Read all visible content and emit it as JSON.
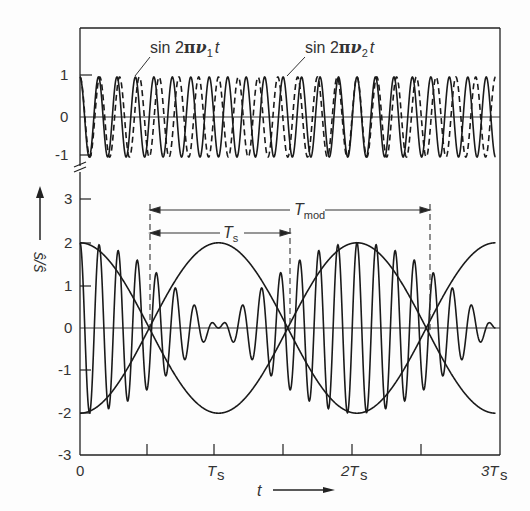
{
  "chart_data": [
    {
      "type": "line",
      "panel": "upper",
      "title": "",
      "series": [
        {
          "name": "sin 2πν1t",
          "style": "solid",
          "amplitude": 1,
          "relative_frequency": 7.5
        },
        {
          "name": "sin 2πν2t",
          "style": "dashed",
          "amplitude": 1,
          "relative_frequency": 7.0
        }
      ],
      "yticks": [
        "1",
        "0",
        "-1"
      ],
      "ylim": [
        -1,
        1
      ],
      "xlim": [
        0,
        3
      ],
      "xunit": "Ts"
    },
    {
      "type": "line",
      "panel": "lower",
      "series": [
        {
          "name": "beat signal (sum)",
          "style": "solid",
          "formula": "sin 2πν1t + sin 2πν2t"
        },
        {
          "name": "envelope",
          "style": "solid",
          "formula": "±2|cos(πt/Ts)|"
        }
      ],
      "yticks": [
        "3",
        "2",
        "1",
        "0",
        "-1",
        "-2",
        "-3"
      ],
      "ylim": [
        -3,
        3
      ],
      "xticks": [
        "0",
        "Ts",
        "2Ts",
        "3Ts"
      ],
      "minor_xticks": [
        0.5,
        1.5,
        2.5
      ],
      "xlim": [
        0,
        3
      ],
      "annotations": [
        {
          "label": "T_mod",
          "from": 0.5,
          "to": 2.5
        },
        {
          "label": "T_s",
          "from": 0.5,
          "to": 1.5
        }
      ]
    }
  ],
  "labels": {
    "upper": {
      "series1": {
        "prefix": "sin 2",
        "pi": "π",
        "nu": "ν",
        "sub": "1",
        "t": "t"
      },
      "series2": {
        "prefix": "sin 2",
        "pi": "π",
        "nu": "ν",
        "sub": "2",
        "t": "t"
      },
      "yticks": [
        "1",
        "0",
        "-1"
      ]
    },
    "lower": {
      "yticks": [
        "3",
        "2",
        "1",
        "0",
        "-1",
        "-2",
        "-3"
      ],
      "xticks": [
        "0",
        "T",
        "2T",
        "3T"
      ],
      "xtick_sub": "s",
      "tmod_main": "T",
      "tmod_sub": "mod",
      "ts_main": "T",
      "ts_sub": "s"
    },
    "xlabel": "t",
    "ylabel": "ŝ/ŝ"
  }
}
